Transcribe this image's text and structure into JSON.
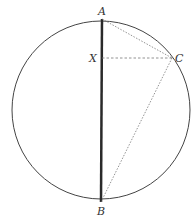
{
  "diagram": {
    "title": "",
    "circle": {
      "cx": 101,
      "cy": 110,
      "r": 89,
      "stroke": "#444444"
    },
    "points": {
      "A": {
        "label": "A",
        "x": 102,
        "y": 19,
        "lx": 98,
        "ly": 15
      },
      "B": {
        "label": "B",
        "x": 101,
        "y": 202,
        "lx": 97,
        "ly": 215
      },
      "C": {
        "label": "C",
        "x": 172,
        "y": 58,
        "lx": 175,
        "ly": 62
      },
      "X": {
        "label": "X",
        "x": 102,
        "y": 58,
        "lx": 89,
        "ly": 62
      }
    },
    "segments": [
      {
        "name": "diameter-AB",
        "from": "A",
        "to": "B",
        "style": "solid-thick"
      },
      {
        "name": "chord-AC",
        "from": "A",
        "to": "C",
        "style": "dotted"
      },
      {
        "name": "segment-XC",
        "from": "X",
        "to": "C",
        "style": "dashed"
      },
      {
        "name": "chord-BC",
        "from": "B",
        "to": "C",
        "style": "dotted"
      }
    ]
  }
}
